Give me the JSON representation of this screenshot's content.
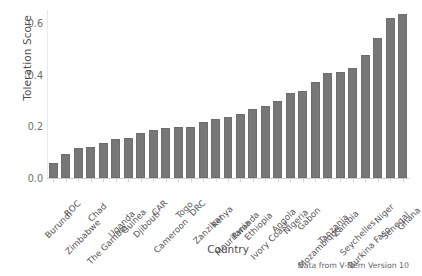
{
  "chart_data": {
    "type": "bar",
    "title": "",
    "xlabel": "Country",
    "ylabel": "Toleration Score",
    "ylim": [
      0.0,
      0.65
    ],
    "yticks": [
      0.0,
      0.2,
      0.4,
      0.6
    ],
    "ytick_labels": [
      "0.0",
      "0.2",
      "0.4",
      "0.6"
    ],
    "grid": false,
    "legend": null,
    "categories": [
      "Burundi",
      "ROC",
      "Zimbabwe",
      "Chad",
      "The Gambia",
      "Uganda",
      "Guinea",
      "Djibouti",
      "CAR",
      "Cameroon",
      "Togo",
      "DRC",
      "Zanzibar",
      "Kenya",
      "Mauritania",
      "Rwanda",
      "Ethiopia",
      "Ivory Coast",
      "Angola",
      "Nigeria",
      "Gabon",
      "Mozambique",
      "Tanzania",
      "Zambia",
      "Seychelles",
      "Burkina Faso",
      "Niger",
      "Senegal",
      "Ghana"
    ],
    "values": [
      0.058,
      0.092,
      0.115,
      0.12,
      0.137,
      0.152,
      0.155,
      0.173,
      0.186,
      0.195,
      0.197,
      0.199,
      0.215,
      0.229,
      0.238,
      0.248,
      0.267,
      0.278,
      0.297,
      0.328,
      0.337,
      0.372,
      0.407,
      0.412,
      0.425,
      0.476,
      0.542,
      0.62,
      0.633
    ],
    "bar_color": "#777777",
    "annotation": "Data from V-Dem Version 10"
  }
}
